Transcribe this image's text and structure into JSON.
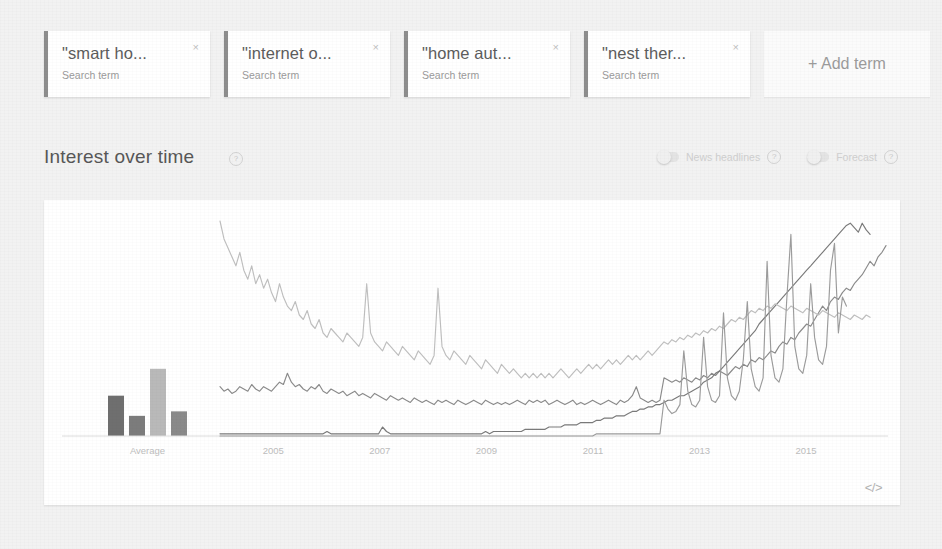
{
  "terms": [
    {
      "label": "\"smart ho...",
      "sublabel": "Search term",
      "close": "×",
      "color": "#7d7d7d",
      "full": "smart home"
    },
    {
      "label": "\"internet o...",
      "sublabel": "Search term",
      "close": "×",
      "color": "#8a8a8a",
      "full": "internet of things"
    },
    {
      "label": "\"home aut...",
      "sublabel": "Search term",
      "close": "×",
      "color": "#949494",
      "full": "home automation"
    },
    {
      "label": "\"nest ther...",
      "sublabel": "Search term",
      "close": "×",
      "color": "#9e9e9e",
      "full": "nest thermostat"
    }
  ],
  "add_term": {
    "label": "+ Add term"
  },
  "section": {
    "title": "Interest over time",
    "help": "?",
    "toggles": [
      {
        "label": "News headlines",
        "help": "?",
        "state": "off"
      },
      {
        "label": "Forecast",
        "help": "?",
        "state": "off"
      }
    ]
  },
  "chart_card": {
    "embed_icon": "</>"
  },
  "chart_data": {
    "type": "line",
    "title": "Interest over time",
    "xlabel": "",
    "ylabel": "",
    "ylim": [
      0,
      100
    ],
    "grid": false,
    "legend_position": "none",
    "average_panel": {
      "type": "bar",
      "label": "Average",
      "categories": [
        "\"smart home\"",
        "\"internet of things\"",
        "\"home automation\"",
        "\"nest thermostat\""
      ],
      "values": [
        18,
        9,
        30,
        11
      ],
      "colors": [
        "#6f6f6f",
        "#7c7c7c",
        "#b9b9b9",
        "#8a8a8a"
      ]
    },
    "x_ticks": [
      "Average",
      "2005",
      "2007",
      "2009",
      "2011",
      "2013",
      "2015"
    ],
    "x_range": [
      "2004-01",
      "2016-06"
    ],
    "series": [
      {
        "name": "\"smart home\"",
        "color": "#8b8b8b",
        "values": [
          22,
          20,
          21,
          19,
          20,
          22,
          21,
          20,
          23,
          21,
          20,
          22,
          21,
          20,
          22,
          24,
          23,
          28,
          24,
          22,
          23,
          21,
          20,
          22,
          21,
          23,
          20,
          19,
          21,
          20,
          19,
          20,
          18,
          19,
          20,
          18,
          19,
          18,
          17,
          19,
          18,
          17,
          16,
          18,
          17,
          16,
          17,
          16,
          15,
          17,
          16,
          15,
          16,
          15,
          14,
          16,
          15,
          16,
          15,
          14,
          16,
          15,
          14,
          15,
          16,
          15,
          14,
          16,
          15,
          14,
          15,
          14,
          15,
          14,
          15,
          16,
          15,
          14,
          16,
          15,
          16,
          15,
          16,
          14,
          15,
          16,
          15,
          14,
          15,
          16,
          14,
          15,
          14,
          15,
          16,
          15,
          14,
          15,
          16,
          15,
          14,
          16,
          15,
          16,
          18,
          22,
          17,
          16,
          15,
          16,
          15,
          16,
          26,
          25,
          24,
          25,
          24,
          26,
          25,
          24,
          26,
          25,
          27,
          26,
          28,
          27,
          29,
          28,
          27,
          29,
          31,
          30,
          32,
          31,
          34,
          33,
          35,
          34,
          36,
          38,
          37,
          40,
          42,
          41,
          44,
          43,
          46,
          48,
          50,
          49,
          52,
          55,
          58,
          56,
          60,
          62,
          61,
          64,
          66,
          65,
          68,
          70,
          72,
          75,
          78,
          76,
          80,
          82,
          85
        ]
      },
      {
        "name": "\"internet of things\"",
        "color": "#7a7a7a",
        "values": [
          1,
          1,
          1,
          1,
          1,
          1,
          1,
          1,
          1,
          1,
          1,
          1,
          1,
          1,
          1,
          1,
          1,
          1,
          1,
          1,
          1,
          1,
          1,
          1,
          1,
          1,
          1,
          2,
          1,
          1,
          1,
          1,
          1,
          1,
          1,
          1,
          1,
          1,
          1,
          1,
          1,
          4,
          2,
          1,
          1,
          1,
          1,
          1,
          1,
          1,
          1,
          1,
          1,
          1,
          1,
          1,
          1,
          1,
          1,
          1,
          1,
          1,
          1,
          1,
          1,
          1,
          1,
          2,
          1,
          2,
          2,
          2,
          2,
          2,
          2,
          2,
          2,
          3,
          3,
          3,
          3,
          3,
          3,
          4,
          4,
          4,
          4,
          5,
          5,
          5,
          5,
          6,
          6,
          6,
          6,
          7,
          7,
          8,
          8,
          8,
          9,
          9,
          9,
          10,
          11,
          11,
          12,
          12,
          13,
          13,
          14,
          14,
          15,
          16,
          16,
          17,
          18,
          18,
          19,
          20,
          21,
          22,
          24,
          25,
          26,
          28,
          29,
          31,
          33,
          35,
          37,
          39,
          41,
          43,
          45,
          47,
          50,
          52,
          54,
          56,
          58,
          60,
          62,
          64,
          66,
          68,
          70,
          72,
          74,
          76,
          78,
          80,
          82,
          84,
          86,
          88,
          90,
          92,
          94,
          95,
          93,
          91,
          95,
          92,
          90
        ]
      },
      {
        "name": "\"home automation\"",
        "color": "#bfbfbf",
        "values": [
          96,
          88,
          84,
          80,
          76,
          82,
          74,
          70,
          76,
          68,
          72,
          66,
          70,
          64,
          60,
          68,
          62,
          58,
          56,
          60,
          54,
          52,
          56,
          50,
          48,
          52,
          46,
          44,
          48,
          46,
          44,
          42,
          46,
          44,
          42,
          40,
          44,
          68,
          46,
          42,
          40,
          38,
          42,
          40,
          38,
          36,
          40,
          38,
          36,
          34,
          38,
          36,
          34,
          32,
          36,
          66,
          40,
          36,
          34,
          38,
          36,
          34,
          32,
          36,
          34,
          32,
          30,
          34,
          32,
          30,
          28,
          32,
          30,
          28,
          30,
          28,
          26,
          28,
          26,
          28,
          26,
          28,
          26,
          28,
          26,
          28,
          30,
          28,
          26,
          28,
          30,
          28,
          30,
          32,
          30,
          32,
          30,
          32,
          34,
          32,
          34,
          32,
          34,
          36,
          34,
          36,
          34,
          36,
          38,
          36,
          38,
          40,
          42,
          41,
          43,
          42,
          44,
          43,
          45,
          44,
          46,
          45,
          47,
          46,
          48,
          47,
          49,
          48,
          50,
          52,
          51,
          53,
          52,
          54,
          56,
          55,
          57,
          56,
          58,
          57,
          59,
          58,
          57,
          56,
          58,
          57,
          56,
          55,
          57,
          56,
          55,
          54,
          56,
          55,
          54,
          53,
          55,
          54,
          53,
          52,
          54,
          53,
          52,
          54,
          53
        ]
      },
      {
        "name": "\"nest thermostat\"",
        "color": "#9c9c9c",
        "values": [
          0,
          0,
          0,
          0,
          0,
          0,
          0,
          0,
          0,
          0,
          0,
          0,
          0,
          0,
          0,
          0,
          0,
          0,
          0,
          0,
          0,
          0,
          0,
          0,
          0,
          0,
          0,
          0,
          0,
          0,
          0,
          0,
          0,
          0,
          0,
          0,
          0,
          0,
          0,
          0,
          0,
          0,
          0,
          0,
          0,
          0,
          0,
          0,
          0,
          0,
          0,
          0,
          0,
          0,
          0,
          0,
          0,
          0,
          0,
          0,
          0,
          0,
          0,
          0,
          0,
          0,
          0,
          0,
          0,
          0,
          0,
          0,
          0,
          0,
          0,
          0,
          0,
          0,
          0,
          0,
          0,
          0,
          0,
          0,
          0,
          0,
          0,
          0,
          0,
          0,
          0,
          0,
          0,
          0,
          0,
          1,
          1,
          1,
          1,
          1,
          1,
          1,
          1,
          1,
          1,
          1,
          1,
          1,
          1,
          1,
          1,
          1,
          16,
          12,
          10,
          11,
          14,
          38,
          20,
          14,
          13,
          16,
          44,
          22,
          16,
          15,
          18,
          55,
          26,
          18,
          16,
          20,
          34,
          60,
          30,
          22,
          20,
          26,
          78,
          36,
          26,
          24,
          30,
          62,
          90,
          40,
          30,
          28,
          36,
          68,
          44,
          34,
          32,
          40,
          74,
          86,
          46,
          62,
          58
        ]
      }
    ]
  }
}
